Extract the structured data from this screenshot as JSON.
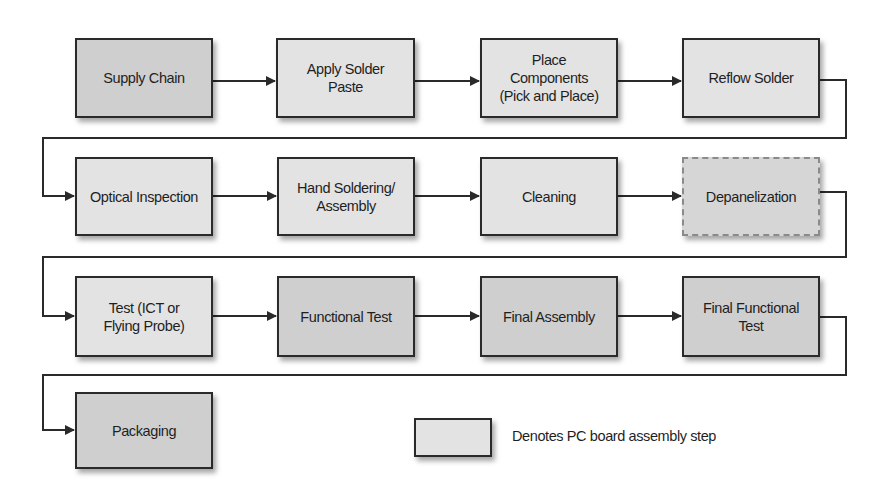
{
  "diagram": {
    "type": "process-flow",
    "steps": [
      {
        "id": 1,
        "label": "Supply Chain",
        "pcb_step": false,
        "style": "solid"
      },
      {
        "id": 2,
        "label": "Apply Solder\nPaste",
        "pcb_step": true,
        "style": "solid"
      },
      {
        "id": 3,
        "label": "Place\nComponents\n(Pick and Place)",
        "pcb_step": true,
        "style": "solid"
      },
      {
        "id": 4,
        "label": "Reflow Solder",
        "pcb_step": true,
        "style": "solid"
      },
      {
        "id": 5,
        "label": "Optical Inspection",
        "pcb_step": true,
        "style": "solid"
      },
      {
        "id": 6,
        "label": "Hand Soldering/\nAssembly",
        "pcb_step": true,
        "style": "solid"
      },
      {
        "id": 7,
        "label": "Cleaning",
        "pcb_step": true,
        "style": "solid"
      },
      {
        "id": 8,
        "label": "Depanelization",
        "pcb_step": true,
        "style": "dashed"
      },
      {
        "id": 9,
        "label": "Test (ICT or\nFlying Probe)",
        "pcb_step": true,
        "style": "solid"
      },
      {
        "id": 10,
        "label": "Functional Test",
        "pcb_step": false,
        "style": "solid"
      },
      {
        "id": 11,
        "label": "Final Assembly",
        "pcb_step": false,
        "style": "solid"
      },
      {
        "id": 12,
        "label": "Final Functional\nTest",
        "pcb_step": false,
        "style": "solid"
      },
      {
        "id": 13,
        "label": "Packaging",
        "pcb_step": false,
        "style": "solid"
      }
    ],
    "legend": {
      "label": "Denotes PC board assembly step"
    },
    "colors": {
      "pcb_fill": "#e3e3e3",
      "other_fill": "#cfcfcf",
      "dashed_border": "#8a8a8a",
      "line": "#2a2a2a"
    }
  }
}
